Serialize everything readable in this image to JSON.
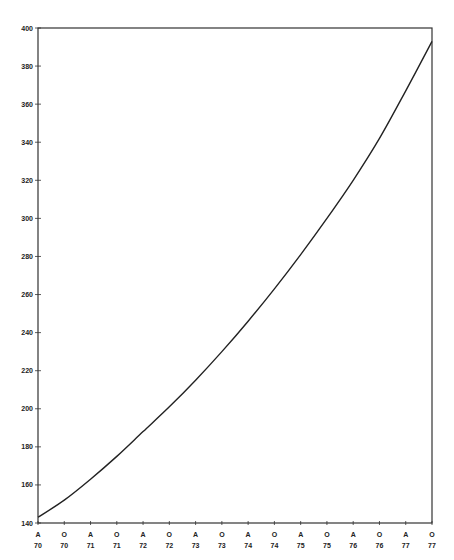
{
  "chart_data": {
    "type": "line",
    "title": "",
    "xlabel": "",
    "ylabel": "",
    "ylim": [
      140,
      400
    ],
    "yticks": [
      140,
      160,
      180,
      200,
      220,
      240,
      260,
      280,
      300,
      320,
      340,
      360,
      380,
      400
    ],
    "categories": [
      {
        "top": "A",
        "bottom": "70"
      },
      {
        "top": "O",
        "bottom": "70"
      },
      {
        "top": "A",
        "bottom": "71"
      },
      {
        "top": "O",
        "bottom": "71"
      },
      {
        "top": "A",
        "bottom": "72"
      },
      {
        "top": "O",
        "bottom": "72"
      },
      {
        "top": "A",
        "bottom": "73"
      },
      {
        "top": "O",
        "bottom": "73"
      },
      {
        "top": "A",
        "bottom": "74"
      },
      {
        "top": "O",
        "bottom": "74"
      },
      {
        "top": "A",
        "bottom": "75"
      },
      {
        "top": "O",
        "bottom": "75"
      },
      {
        "top": "A",
        "bottom": "76"
      },
      {
        "top": "O",
        "bottom": "76"
      },
      {
        "top": "A",
        "bottom": "77"
      },
      {
        "top": "O",
        "bottom": "77"
      }
    ],
    "series": [
      {
        "name": "curve",
        "values": [
          143,
          152,
          163,
          175,
          188,
          201,
          215,
          230,
          246,
          263,
          281,
          300,
          320,
          342,
          367,
          393
        ]
      }
    ],
    "grid": false,
    "legend": null,
    "colors": {
      "line": "#222222",
      "axis": "#333333"
    }
  }
}
